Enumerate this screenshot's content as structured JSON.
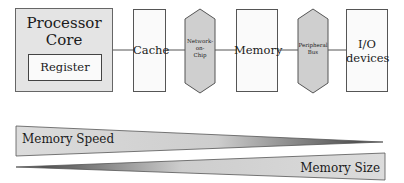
{
  "diagram": {
    "blocks": {
      "processor": {
        "title_line1": "Processor",
        "title_line2": "Core",
        "register": "Register"
      },
      "cache": {
        "label": "Cache"
      },
      "noc": {
        "line1": "Network-",
        "line2": "on-",
        "line3": "Chip"
      },
      "memory": {
        "label": "Memory"
      },
      "peripheral_bus": {
        "line1": "Peripheral",
        "line2": "Bus"
      },
      "io": {
        "line1": "I/O",
        "line2": "devices"
      }
    },
    "wedges": {
      "speed": {
        "label": "Memory Speed"
      },
      "size": {
        "label": "Memory Size"
      }
    },
    "colors": {
      "block_fill": "#e4e4e4",
      "white_fill": "#fafafa",
      "hex_fill": "#cfcfcf",
      "stroke": "#555555"
    }
  }
}
